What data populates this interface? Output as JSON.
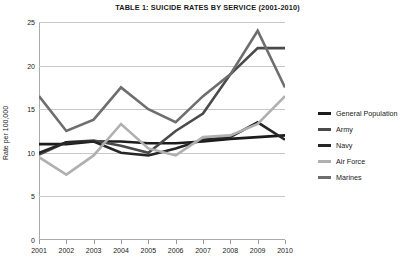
{
  "chart_data": {
    "type": "line",
    "title": "TABLE 1: SUICIDE RATES BY SERVICE (2001-2010)",
    "xlabel": "",
    "ylabel": "Rate per 100,000",
    "categories": [
      "2001",
      "2002",
      "2003",
      "2004",
      "2005",
      "2006",
      "2007",
      "2008",
      "2009",
      "2010"
    ],
    "x": [
      2001,
      2002,
      2003,
      2004,
      2005,
      2006,
      2007,
      2008,
      2009,
      2010
    ],
    "ylim": [
      0,
      25
    ],
    "yticks": [
      0,
      5,
      10,
      15,
      20,
      25
    ],
    "grid": true,
    "legend_position": "right",
    "series": [
      {
        "name": "General Population",
        "color": "#1c1c1c",
        "width": 2.6,
        "values": [
          11.0,
          11.0,
          11.3,
          11.3,
          11.1,
          11.1,
          11.3,
          11.6,
          11.8,
          12.0
        ]
      },
      {
        "name": "Army",
        "color": "#4a4a4a",
        "width": 2.6,
        "values": [
          9.8,
          11.2,
          11.4,
          10.8,
          10.0,
          12.5,
          14.5,
          19.0,
          22.0,
          22.0
        ]
      },
      {
        "name": "Navy",
        "color": "#262626",
        "width": 2.6,
        "values": [
          10.0,
          11.2,
          11.3,
          10.0,
          9.7,
          10.5,
          11.5,
          11.8,
          13.5,
          11.5
        ]
      },
      {
        "name": "Air Force",
        "color": "#b0b0b0",
        "width": 2.6,
        "values": [
          9.5,
          7.5,
          9.7,
          13.3,
          10.5,
          9.7,
          11.8,
          12.0,
          13.3,
          16.5
        ]
      },
      {
        "name": "Marines",
        "color": "#6e6e6e",
        "width": 2.6,
        "values": [
          16.5,
          12.5,
          13.8,
          17.5,
          15.0,
          13.5,
          16.5,
          19.0,
          24.0,
          17.5
        ]
      }
    ]
  }
}
